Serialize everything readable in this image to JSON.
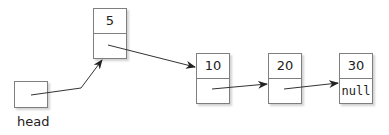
{
  "diagram": {
    "type": "singly-linked-list",
    "head": {
      "label": "head"
    },
    "nodes": [
      {
        "value": "5",
        "next": ""
      },
      {
        "value": "10",
        "next": ""
      },
      {
        "value": "20",
        "next": ""
      },
      {
        "value": "30",
        "next": "null"
      }
    ],
    "colors": {
      "stroke": "#7f7f7f",
      "arrow": "#333333",
      "text": "#222222"
    }
  }
}
